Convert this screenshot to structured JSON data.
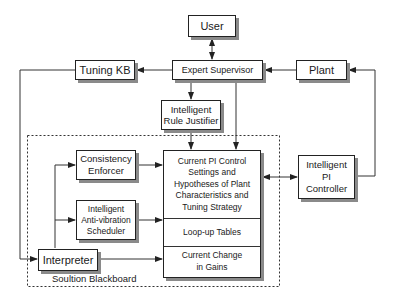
{
  "diagram": {
    "nodes": {
      "user": {
        "label": "User"
      },
      "expert_supervisor": {
        "label": "Expert Supervisor"
      },
      "tuning_kb": {
        "label": "Tuning KB"
      },
      "plant": {
        "label": "Plant"
      },
      "rule_justifier": {
        "line1": "Intelligent",
        "line2": "Rule Justifier"
      },
      "consistency_enforcer": {
        "line1": "Consistency",
        "line2": "Enforcer"
      },
      "anti_vibration_scheduler": {
        "line1": "Intelligent",
        "line2": "Anti-vibration",
        "line3": "Scheduler"
      },
      "interpreter": {
        "label": "Interpreter"
      },
      "pi_controller": {
        "line1": "Intelligent",
        "line2": "PI",
        "line3": "Controller"
      },
      "blackboard_main": {
        "section1": {
          "line1": "Current PI Control",
          "line2": "Settings and",
          "line3": "Hypotheses of Plant",
          "line4": "Characteristics and",
          "line5": "Tuning Strategy"
        },
        "section2": {
          "line1": "Loop-up Tables"
        },
        "section3": {
          "line1": "Current Change",
          "line2": "in Gains"
        }
      }
    },
    "group_label": "Soultion  Blackboard",
    "edges": [
      {
        "from": "User",
        "to": "Expert Supervisor",
        "type": "bidirectional"
      },
      {
        "from": "Expert Supervisor",
        "to": "Tuning KB"
      },
      {
        "from": "Plant",
        "to": "Expert Supervisor"
      },
      {
        "from": "Expert Supervisor",
        "to": "Intelligent Rule Justifier"
      },
      {
        "from": "Expert Supervisor",
        "to": "Blackboard Main"
      },
      {
        "from": "Intelligent Rule Justifier",
        "to": "Blackboard Main"
      },
      {
        "from": "Tuning KB",
        "to": "Interpreter"
      },
      {
        "from": "Interpreter",
        "to": "Consistency Enforcer"
      },
      {
        "from": "Interpreter",
        "to": "Intelligent Anti-vibration Scheduler"
      },
      {
        "from": "Interpreter",
        "to": "Blackboard Main"
      },
      {
        "from": "Consistency Enforcer",
        "to": "Blackboard Main"
      },
      {
        "from": "Intelligent Anti-vibration Scheduler",
        "to": "Blackboard Main"
      },
      {
        "from": "Blackboard Main",
        "to": "Intelligent PI Controller",
        "type": "bidirectional"
      },
      {
        "from": "Intelligent PI Controller",
        "to": "Plant"
      }
    ]
  }
}
